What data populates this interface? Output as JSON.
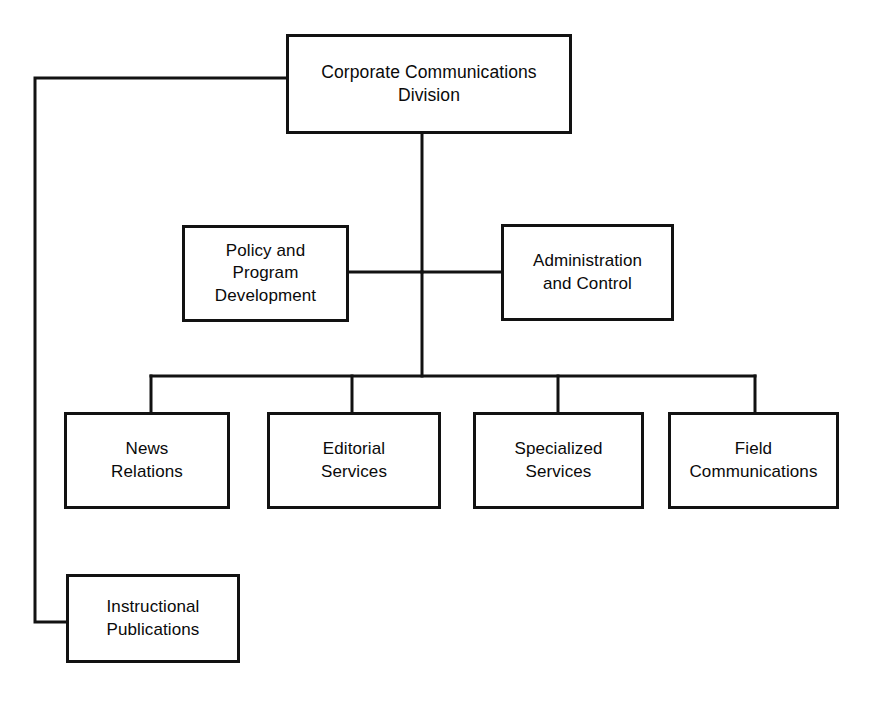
{
  "diagram": {
    "type": "organization-chart",
    "line_color": "#121212",
    "background_color": "#ffffff",
    "text_color": "#0a0a0a"
  },
  "nodes": {
    "root": {
      "label": "Corporate Communications\nDivision",
      "level": 0,
      "x": 286,
      "y": 34,
      "w": 286,
      "h": 100
    },
    "policy": {
      "label": "Policy and\nProgram\nDevelopment",
      "level": 1,
      "x": 182,
      "y": 225,
      "w": 167,
      "h": 97
    },
    "administration": {
      "label": "Administration\nand Control",
      "level": 1,
      "x": 501,
      "y": 224,
      "w": 173,
      "h": 97
    },
    "news": {
      "label": "News\nRelations",
      "level": 2,
      "x": 64,
      "y": 412,
      "w": 166,
      "h": 97
    },
    "editorial": {
      "label": "Editorial\nServices",
      "level": 2,
      "x": 267,
      "y": 412,
      "w": 174,
      "h": 97
    },
    "specialized": {
      "label": "Specialized\nServices",
      "level": 2,
      "x": 473,
      "y": 412,
      "w": 171,
      "h": 97
    },
    "field": {
      "label": "Field\nCommunications",
      "level": 2,
      "x": 668,
      "y": 412,
      "w": 171,
      "h": 97
    },
    "instructional": {
      "label": "Instructional\nPublications",
      "level": 3,
      "x": 66,
      "y": 574,
      "w": 174,
      "h": 89
    }
  },
  "connectors": {
    "root_to_instructional": "M 286 78 L 35 78 L 35 622 L 66 622",
    "root_spine": "M 422 134 L 422 376",
    "policy_to_spine": "M 349 272 L 422 272",
    "administration_to_spine": "M 422 272 L 501 272",
    "distribution_bar": "M 151 376 L 755 376",
    "leg_news": "M 151 376 L 151 412",
    "leg_editorial": "M 352 376 L 352 412",
    "leg_specialized": "M 558 376 L 558 412",
    "leg_field": "M 755 376 L 755 412"
  }
}
